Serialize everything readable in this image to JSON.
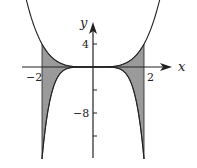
{
  "chart_data": {
    "type": "area",
    "title": "",
    "xlabel": "x",
    "ylabel": "y",
    "series": [
      {
        "name": "upper curve",
        "formula": "y = x^4/4",
        "x": [
          -2.8,
          -2,
          -1,
          0,
          1,
          2,
          2.8
        ],
        "values": [
          15.4,
          4,
          0.25,
          0,
          0.25,
          4,
          15.4
        ]
      },
      {
        "name": "lower curve",
        "formula": "y = -x^6/4",
        "x": [
          -2,
          -1,
          0,
          1,
          2
        ],
        "values": [
          -16,
          -0.25,
          0,
          -0.25,
          -16
        ]
      }
    ],
    "shaded_region": {
      "between": [
        "upper curve",
        "lower curve"
      ],
      "x_range": [
        -2,
        2
      ],
      "color": "#9a9a9a"
    },
    "x_ticks": [
      {
        "value": -2,
        "label": "−2"
      },
      {
        "value": 2,
        "label": "2"
      }
    ],
    "y_ticks": [
      {
        "value": 4,
        "label": "4"
      },
      {
        "value": -4,
        "label": ""
      },
      {
        "value": -8,
        "label": "−8"
      },
      {
        "value": -12,
        "label": ""
      }
    ],
    "xlim": [
      -3,
      3.2
    ],
    "ylim": [
      -16,
      8.5
    ],
    "grid": false
  },
  "labels": {
    "x_axis": "x",
    "y_axis": "y",
    "xtick_neg2": "−2",
    "xtick_2": "2",
    "ytick_4": "4",
    "ytick_neg8": "−8"
  }
}
